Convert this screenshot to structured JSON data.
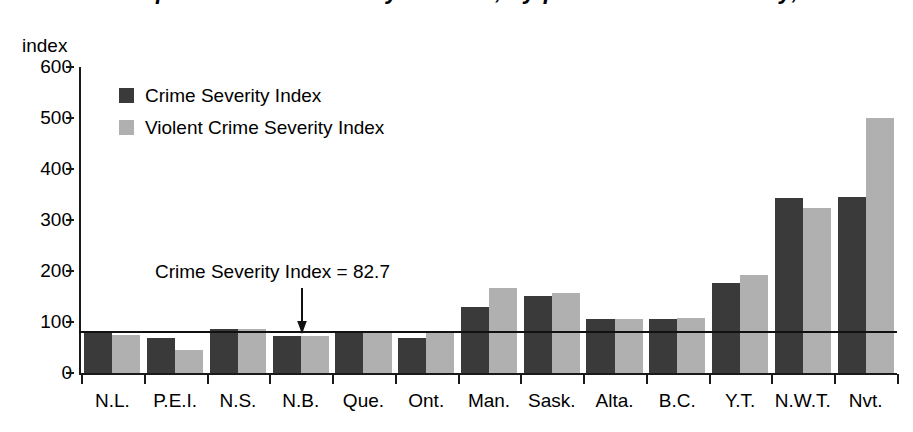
{
  "chart_data": {
    "type": "bar",
    "title": "Police-reported crime severity indexes, by province and territory, 2010",
    "ylabel": "index",
    "xlabel": "",
    "ylim": [
      0,
      600
    ],
    "yticks": [
      0,
      100,
      200,
      300,
      400,
      500,
      600
    ],
    "grid": false,
    "legend_position": "upper-left",
    "categories": [
      "N.L.",
      "P.E.I.",
      "N.S.",
      "N.B.",
      "Que.",
      "Ont.",
      "Man.",
      "Sask.",
      "Alta.",
      "B.C.",
      "Y.T.",
      "N.W.T.",
      "Nvt."
    ],
    "series": [
      {
        "name": "Crime Severity Index",
        "color": "#3a3a3a",
        "values": [
          78,
          68,
          86,
          72,
          80,
          69,
          130,
          151,
          105,
          106,
          176,
          343,
          345
        ]
      },
      {
        "name": "Violent Crime Severity Index",
        "color": "#b0b0b0",
        "values": [
          75,
          45,
          86,
          73,
          80,
          78,
          166,
          157,
          105,
          107,
          192,
          323,
          500
        ]
      }
    ],
    "annotations": [
      {
        "text": "Crime Severity Index = 82.7",
        "value": 82.7,
        "type": "reference-line",
        "arrow": "down"
      }
    ]
  },
  "legend": {
    "items": [
      {
        "label": "Crime Severity Index",
        "color": "#3a3a3a"
      },
      {
        "label": "Violent Crime Severity Index",
        "color": "#b0b0b0"
      }
    ]
  },
  "annotation": {
    "label": "Crime Severity Index = 82.7"
  },
  "axis": {
    "y_title": "index"
  }
}
